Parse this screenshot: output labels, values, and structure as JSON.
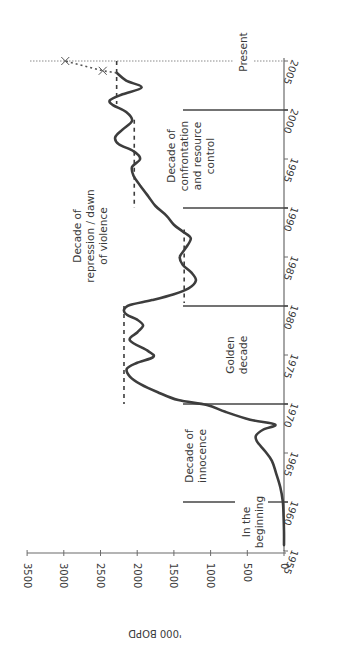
{
  "chart_data": {
    "type": "line",
    "orientation": "rotated-90-ccw",
    "title": "",
    "xlabel": "",
    "ylabel": "'000 BOPD",
    "xlim": [
      1955,
      2005
    ],
    "ylim": [
      0,
      3500
    ],
    "x_ticks": [
      1955,
      1960,
      1965,
      1970,
      1975,
      1980,
      1985,
      1990,
      1995,
      2000,
      2005
    ],
    "y_ticks": [
      0,
      500,
      1000,
      1500,
      2000,
      2500,
      3000,
      3500
    ],
    "grid": false,
    "series": [
      {
        "name": "Oil production",
        "style": "solid",
        "x": [
          1955.6,
          1957,
          1958.5,
          1960,
          1961.5,
          1963,
          1964.2,
          1965.2,
          1966.2,
          1966.8,
          1967.4,
          1967.9,
          1968.4,
          1969.2,
          1969.9,
          1970.4,
          1971.2,
          1972,
          1972.8,
          1973.6,
          1974.2,
          1974.8,
          1975.4,
          1976.5,
          1977.3,
          1978,
          1978.6,
          1979.1,
          1979.6,
          1980.1,
          1980.6,
          1981.2,
          1981.8,
          1982.6,
          1983.4,
          1984.2,
          1985,
          1985.8,
          1986.9,
          1987.6,
          1988.3,
          1989.2,
          1990.2,
          1991.2,
          1992.3,
          1993.3,
          1994.2,
          1995,
          1995.8,
          1996.5,
          1997.2,
          1998,
          1998.9,
          1999.8,
          2000.5,
          2001,
          2001.6,
          2002.3,
          2003,
          2003.8
        ],
        "y": [
          0,
          0,
          5,
          15,
          50,
          110,
          165,
          260,
          370,
          380,
          280,
          120,
          460,
          800,
          1050,
          1440,
          1720,
          1950,
          2100,
          2140,
          2000,
          1780,
          1850,
          2100,
          2000,
          1920,
          2000,
          2140,
          2180,
          2100,
          1800,
          1500,
          1300,
          1200,
          1260,
          1380,
          1420,
          1350,
          1270,
          1380,
          1500,
          1600,
          1750,
          1850,
          1960,
          2050,
          2070,
          1960,
          2050,
          2250,
          2300,
          2200,
          2070,
          2150,
          2330,
          2370,
          2200,
          1940,
          2150,
          2280
        ]
      },
      {
        "name": "Projection",
        "style": "dotted",
        "x": [
          2003.8,
          2004,
          2005
        ],
        "y": [
          2280,
          2470,
          2980
        ],
        "markers": [
          {
            "x": 2004,
            "y": 2470,
            "symbol": "x"
          },
          {
            "x": 2005,
            "y": 2980,
            "symbol": "x"
          }
        ]
      }
    ],
    "reference_lines": [
      {
        "type": "dashed-average",
        "x_range": [
          1980.3,
          1987.8
        ],
        "value": 1360
      },
      {
        "type": "dashed-average",
        "x_range": [
          1970,
          1980
        ],
        "value": 2180
      },
      {
        "type": "dashed-average",
        "x_range": [
          1990,
          1999
        ],
        "value": 2040
      },
      {
        "type": "dashed-average",
        "x_range": [
          2000.6,
          2005
        ],
        "value": 2280
      }
    ],
    "era_dividers": [
      1960,
      1970,
      1980,
      1990,
      2000
    ],
    "annotations": [
      {
        "text": "In the beginning",
        "x": 1958,
        "position": "near-axis"
      },
      {
        "text": "Decade of innocence",
        "x": 1965
      },
      {
        "text": "Golden decade",
        "x": 1975
      },
      {
        "text": "Decade of repression / dawn of violence",
        "x": 1985
      },
      {
        "text": "Decade of confrontation and resource control",
        "x": 1995
      },
      {
        "text": "Present",
        "x": 2005
      }
    ],
    "legend": null
  },
  "labels": {
    "y_axis_title": "'000 BOPD",
    "era": {
      "beginning": [
        "In the",
        "beginning"
      ],
      "innocence": [
        "Decade of",
        "innocence"
      ],
      "golden": [
        "Golden",
        "decade"
      ],
      "repression": [
        "Decade of",
        "repression / dawn",
        "of violence"
      ],
      "confrontation": [
        "Decade of",
        "confrontation",
        "and resource",
        "control"
      ],
      "present": [
        "Present"
      ]
    }
  }
}
